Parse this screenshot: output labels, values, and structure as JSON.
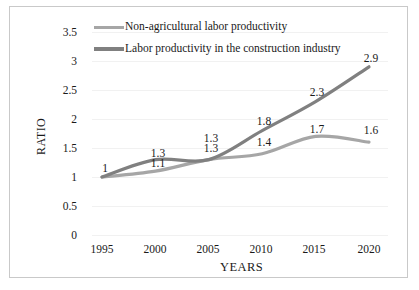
{
  "chart_data": {
    "type": "line",
    "title": "",
    "xlabel": "YEARS",
    "ylabel": "RATIO",
    "categories": [
      "1995",
      "2000",
      "2005",
      "2010",
      "2015",
      "2020"
    ],
    "x": [
      1995,
      2000,
      2005,
      2010,
      2015,
      2020
    ],
    "ylim": [
      0,
      3.5
    ],
    "xlim": [
      1995,
      2020
    ],
    "yticks": [
      "0",
      "0.5",
      "1",
      "1.5",
      "2",
      "2.5",
      "3",
      "3.5"
    ],
    "ytick_values": [
      0,
      0.5,
      1,
      1.5,
      2,
      2.5,
      3,
      3.5
    ],
    "grid": true,
    "legend_position": "top",
    "series": [
      {
        "name": "Non-agricultural labor productivity",
        "color": "#a6a6a6",
        "values": [
          1,
          1.1,
          1.3,
          1.4,
          1.7,
          1.6
        ],
        "labels": [
          "1",
          "1.1",
          "1.3",
          "1.4",
          "1.7",
          "1.6"
        ]
      },
      {
        "name": "Labor productivity in the construction industry",
        "color": "#808080",
        "values": [
          1,
          1.3,
          1.3,
          1.8,
          2.3,
          2.9
        ],
        "labels": [
          "1",
          "1.3",
          "1.3",
          "1.8",
          "2.3",
          "2.9"
        ]
      }
    ],
    "annotations": [
      {
        "text": "1",
        "x": 1995,
        "y": 1.0
      },
      {
        "text": "1.3",
        "x": 2000,
        "y": 1.3
      },
      {
        "text": "1.1",
        "x": 2000,
        "y": 1.1
      },
      {
        "text": "1.3",
        "x": 2005,
        "y": 1.3
      },
      {
        "text": "1.4",
        "x": 2005,
        "y": 1.4
      },
      {
        "text": "1.8",
        "x": 2010,
        "y": 1.8
      },
      {
        "text": "1.4",
        "x": 2010,
        "y": 1.4
      },
      {
        "text": "2.3",
        "x": 2015,
        "y": 2.3
      },
      {
        "text": "1.7",
        "x": 2015,
        "y": 1.7
      },
      {
        "text": "2.9",
        "x": 2020,
        "y": 2.9
      },
      {
        "text": "1.6",
        "x": 2020,
        "y": 1.6
      }
    ]
  },
  "legend": {
    "items": [
      {
        "label": "Non-agricultural labor productivity",
        "color": "#a6a6a6"
      },
      {
        "label": "Labor productivity in the construction industry",
        "color": "#808080"
      }
    ]
  },
  "axes": {
    "y_title": "RATIO",
    "x_title": "YEARS",
    "y_ticks": [
      "3.5",
      "3",
      "2.5",
      "2",
      "1.5",
      "1",
      "0.5",
      "0"
    ],
    "x_ticks": [
      "1995",
      "2000",
      "2005",
      "2010",
      "2015",
      "2020"
    ]
  },
  "data_labels": {
    "nonag": [
      "1",
      "1.1",
      "1.3",
      "1.4",
      "1.7",
      "1.6"
    ],
    "construction": [
      "1",
      "1.3",
      "1.3",
      "1.8",
      "2.3",
      "2.9"
    ]
  }
}
